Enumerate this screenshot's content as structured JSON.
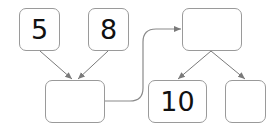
{
  "diagram": {
    "boxes": [
      {
        "id": "top-left-1",
        "value": "5"
      },
      {
        "id": "top-left-2",
        "value": "8"
      },
      {
        "id": "sum-box",
        "value": ""
      },
      {
        "id": "top-right",
        "value": ""
      },
      {
        "id": "bottom-right-1",
        "value": "10"
      },
      {
        "id": "bottom-right-2",
        "value": ""
      }
    ],
    "colors": {
      "border": "#9a9a9a",
      "arrow": "#7a7a7a",
      "text": "#111111"
    }
  }
}
